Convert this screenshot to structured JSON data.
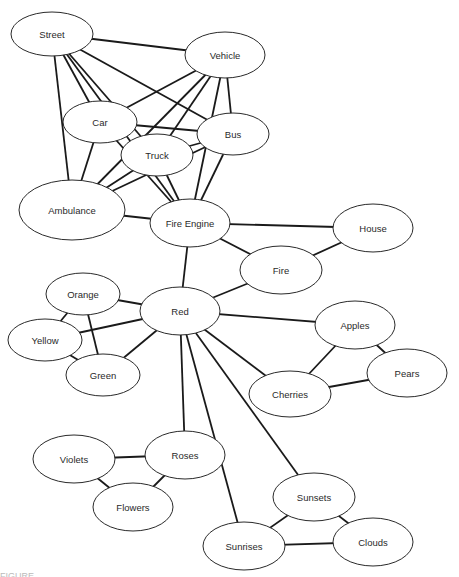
{
  "diagram": {
    "type": "semantic-network",
    "nodes": [
      {
        "id": "street",
        "label": "Street",
        "cx": 52,
        "cy": 34,
        "rx": 41,
        "ry": 22
      },
      {
        "id": "vehicle",
        "label": "Vehicle",
        "cx": 225,
        "cy": 55,
        "rx": 40,
        "ry": 23
      },
      {
        "id": "car",
        "label": "Car",
        "cx": 100,
        "cy": 122,
        "rx": 37,
        "ry": 21
      },
      {
        "id": "bus",
        "label": "Bus",
        "cx": 233,
        "cy": 134,
        "rx": 36,
        "ry": 21
      },
      {
        "id": "truck",
        "label": "Truck",
        "cx": 157,
        "cy": 155,
        "rx": 36,
        "ry": 21
      },
      {
        "id": "ambulance",
        "label": "Ambulance",
        "cx": 72,
        "cy": 210,
        "rx": 53,
        "ry": 30
      },
      {
        "id": "fire_engine",
        "label": "Fire Engine",
        "cx": 190,
        "cy": 223,
        "rx": 40,
        "ry": 24
      },
      {
        "id": "house",
        "label": "House",
        "cx": 373,
        "cy": 228,
        "rx": 40,
        "ry": 24
      },
      {
        "id": "fire",
        "label": "Fire",
        "cx": 281,
        "cy": 270,
        "rx": 41,
        "ry": 24
      },
      {
        "id": "orange",
        "label": "Orange",
        "cx": 83,
        "cy": 294,
        "rx": 37,
        "ry": 21
      },
      {
        "id": "red",
        "label": "Red",
        "cx": 180,
        "cy": 311,
        "rx": 40,
        "ry": 24
      },
      {
        "id": "yellow",
        "label": "Yellow",
        "cx": 45,
        "cy": 340,
        "rx": 37,
        "ry": 21
      },
      {
        "id": "green",
        "label": "Green",
        "cx": 103,
        "cy": 375,
        "rx": 37,
        "ry": 21
      },
      {
        "id": "apples",
        "label": "Apples",
        "cx": 355,
        "cy": 325,
        "rx": 40,
        "ry": 24
      },
      {
        "id": "pears",
        "label": "Pears",
        "cx": 407,
        "cy": 373,
        "rx": 40,
        "ry": 24
      },
      {
        "id": "cherries",
        "label": "Cherries",
        "cx": 290,
        "cy": 394,
        "rx": 41,
        "ry": 23
      },
      {
        "id": "violets",
        "label": "Violets",
        "cx": 74,
        "cy": 459,
        "rx": 41,
        "ry": 24
      },
      {
        "id": "roses",
        "label": "Roses",
        "cx": 185,
        "cy": 455,
        "rx": 40,
        "ry": 24
      },
      {
        "id": "flowers",
        "label": "Flowers",
        "cx": 133,
        "cy": 507,
        "rx": 40,
        "ry": 24
      },
      {
        "id": "sunsets",
        "label": "Sunsets",
        "cx": 314,
        "cy": 497,
        "rx": 41,
        "ry": 24
      },
      {
        "id": "sunrises",
        "label": "Sunrises",
        "cx": 244,
        "cy": 546,
        "rx": 41,
        "ry": 24
      },
      {
        "id": "clouds",
        "label": "Clouds",
        "cx": 373,
        "cy": 542,
        "rx": 40,
        "ry": 24
      }
    ],
    "edges": [
      [
        "street",
        "vehicle"
      ],
      [
        "street",
        "bus"
      ],
      [
        "street",
        "truck"
      ],
      [
        "street",
        "car"
      ],
      [
        "street",
        "fire_engine"
      ],
      [
        "street",
        "ambulance"
      ],
      [
        "vehicle",
        "car"
      ],
      [
        "vehicle",
        "truck"
      ],
      [
        "vehicle",
        "ambulance"
      ],
      [
        "vehicle",
        "fire_engine"
      ],
      [
        "vehicle",
        "bus"
      ],
      [
        "car",
        "bus"
      ],
      [
        "car",
        "ambulance"
      ],
      [
        "car",
        "fire_engine"
      ],
      [
        "truck",
        "bus"
      ],
      [
        "truck",
        "ambulance"
      ],
      [
        "truck",
        "fire_engine"
      ],
      [
        "bus",
        "ambulance"
      ],
      [
        "bus",
        "fire_engine"
      ],
      [
        "ambulance",
        "fire_engine"
      ],
      [
        "fire_engine",
        "house"
      ],
      [
        "fire_engine",
        "fire"
      ],
      [
        "fire_engine",
        "red"
      ],
      [
        "house",
        "fire"
      ],
      [
        "fire",
        "red"
      ],
      [
        "red",
        "orange"
      ],
      [
        "red",
        "yellow"
      ],
      [
        "red",
        "green"
      ],
      [
        "orange",
        "yellow"
      ],
      [
        "orange",
        "green"
      ],
      [
        "yellow",
        "green"
      ],
      [
        "red",
        "apples"
      ],
      [
        "red",
        "cherries"
      ],
      [
        "apples",
        "pears"
      ],
      [
        "apples",
        "cherries"
      ],
      [
        "cherries",
        "pears"
      ],
      [
        "red",
        "roses"
      ],
      [
        "red",
        "sunsets"
      ],
      [
        "red",
        "sunrises"
      ],
      [
        "violets",
        "roses"
      ],
      [
        "violets",
        "flowers"
      ],
      [
        "roses",
        "flowers"
      ],
      [
        "sunsets",
        "sunrises"
      ],
      [
        "sunsets",
        "clouds"
      ],
      [
        "sunrises",
        "clouds"
      ]
    ]
  },
  "caption": {
    "text": "FIGURE"
  }
}
